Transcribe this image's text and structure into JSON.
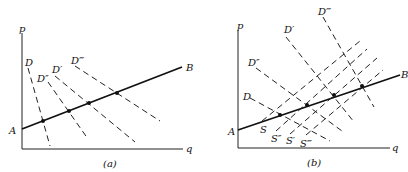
{
  "panels": [
    {
      "caption": "(a)",
      "axis_labels": {
        "y": "p",
        "x": "q"
      },
      "main_line": {
        "start_label": "A",
        "end_label": "B"
      },
      "demand_curves": [
        "D",
        "D″",
        "D′",
        "D‴"
      ],
      "intersection_points": 4
    },
    {
      "caption": "(b)",
      "axis_labels": {
        "y": "p",
        "x": "q"
      },
      "main_line": {
        "start_label": "A",
        "end_label": "B"
      },
      "demand_curves": [
        "D",
        "D″",
        "D′",
        "D‴"
      ],
      "supply_curves": [
        "S",
        "S″",
        "S′",
        "S‴"
      ],
      "intersection_points": 4
    }
  ],
  "colors": {
    "ink": "#111111",
    "background": "#ffffff"
  }
}
